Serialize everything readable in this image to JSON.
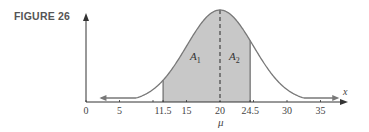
{
  "figure": {
    "label": "FIGURE 26"
  },
  "chart_data": {
    "type": "area",
    "title": "FIGURE 26",
    "distribution": {
      "mean": 20,
      "sd": 5
    },
    "xlabel": "x",
    "ylabel": "",
    "xlim": [
      0,
      38
    ],
    "x_ticks": [
      0,
      5,
      11.5,
      15,
      20,
      24.5,
      30,
      35
    ],
    "x_tick_labels": [
      "0",
      "5",
      "11.5",
      "15",
      "20",
      "24.5",
      "30",
      "35"
    ],
    "minor_ticks": [
      10,
      25
    ],
    "shaded_region": {
      "from": 11.5,
      "to": 24.5,
      "color": "#c8c8c8"
    },
    "mean_line": {
      "x": 20,
      "style": "dashed",
      "label": "μ"
    },
    "areas": [
      {
        "name": "A",
        "sub": "1",
        "from": 11.5,
        "to": 20
      },
      {
        "name": "A",
        "sub": "2",
        "from": 20,
        "to": 24.5
      }
    ],
    "grid": false,
    "legend": "none"
  },
  "labels": {
    "mu": "μ",
    "x_axis": "x",
    "a1_main": "A",
    "a1_sub": "1",
    "a2_main": "A",
    "a2_sub": "2"
  },
  "colors": {
    "curve": "#787878",
    "shade": "#c8c8c8",
    "axis": "#333333"
  }
}
